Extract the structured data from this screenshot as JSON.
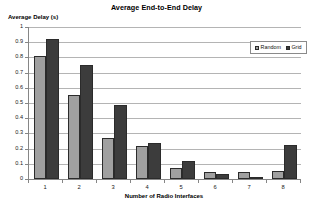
{
  "chart_data": {
    "type": "bar",
    "title": "Average End-to-End Delay",
    "xlabel": "Number of Radio Interfaces",
    "ylabel": "Average Delay (s)",
    "categories": [
      "1",
      "2",
      "3",
      "4",
      "5",
      "6",
      "7",
      "8"
    ],
    "series": [
      {
        "name": "Random",
        "color": "#a0a0a0",
        "values": [
          0.81,
          0.55,
          0.27,
          0.22,
          0.072,
          0.045,
          0.047,
          0.05
        ]
      },
      {
        "name": "Grid",
        "color": "#3c3c3c",
        "values": [
          0.92,
          0.75,
          0.49,
          0.24,
          0.12,
          0.035,
          0.007,
          0.225
        ]
      }
    ],
    "ylim": [
      0,
      1
    ],
    "ytick_step": 0.1,
    "yticks": [
      "0",
      "0.1",
      "0.2",
      "0.3",
      "0.4",
      "0.5",
      "0.6",
      "0.7",
      "0.8",
      "0.9",
      "1"
    ],
    "grid": true,
    "grid_axis": "y",
    "legend_position": "top-right",
    "bar_border_color": "#2b2b2b",
    "gridline_color": "#b4b4b4",
    "axis_color": "#868686",
    "background": "#ffffff"
  }
}
